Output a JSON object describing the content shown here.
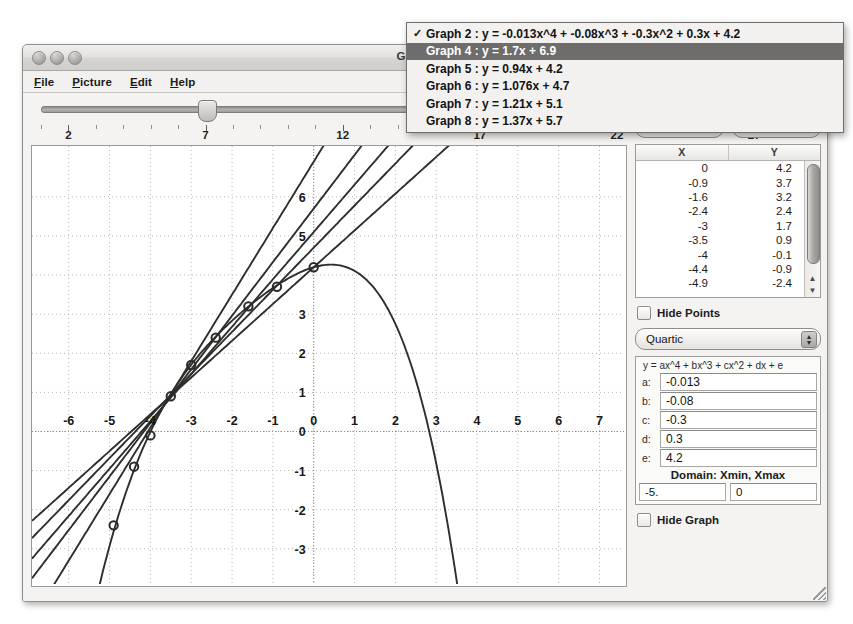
{
  "window": {
    "title": "GridPic /G",
    "traffic_lights": [
      "close",
      "minimize",
      "zoom"
    ],
    "menus": [
      {
        "label": "File",
        "mnemonic": "F"
      },
      {
        "label": "Picture",
        "mnemonic": "P"
      },
      {
        "label": "Edit",
        "mnemonic": "E"
      },
      {
        "label": "Help",
        "mnemonic": "H"
      }
    ]
  },
  "slider": {
    "value": 7,
    "min": 1,
    "max": 29,
    "labels": [
      2,
      7,
      12,
      17,
      22,
      27
    ]
  },
  "graph_menu": {
    "items": [
      {
        "checked": true,
        "selected": false,
        "label": "Graph 2  :  y = -0.013x^4 + -0.08x^3 + -0.3x^2 + 0.3x + 4.2"
      },
      {
        "checked": false,
        "selected": true,
        "label": "Graph 4  :  y = 1.7x + 6.9"
      },
      {
        "checked": false,
        "selected": false,
        "label": "Graph 5  :  y = 0.94x + 4.2"
      },
      {
        "checked": false,
        "selected": false,
        "label": "Graph 6  :  y = 1.076x + 4.7"
      },
      {
        "checked": false,
        "selected": false,
        "label": "Graph 7  :  y = 1.21x + 5.1"
      },
      {
        "checked": false,
        "selected": false,
        "label": "Graph 8  :  y = 1.37x + 5.7"
      }
    ],
    "check_glyph": "✓"
  },
  "buttons": {
    "add_label": "Add",
    "remove_label": "Remove"
  },
  "data_table": {
    "columns": [
      "X",
      "Y"
    ],
    "rows": [
      {
        "x": "0",
        "y": "4.2"
      },
      {
        "x": "-0.9",
        "y": "3.7"
      },
      {
        "x": "-1.6",
        "y": "3.2"
      },
      {
        "x": "-2.4",
        "y": "2.4"
      },
      {
        "x": "-3",
        "y": "1.7"
      },
      {
        "x": "-3.5",
        "y": "0.9"
      },
      {
        "x": "-4",
        "y": "-0.1"
      },
      {
        "x": "-4.4",
        "y": "-0.9"
      },
      {
        "x": "-4.9",
        "y": "-2.4"
      }
    ],
    "scroll_up_glyph": "▲",
    "scroll_down_glyph": "▼"
  },
  "controls": {
    "hide_points_label": "Hide Points",
    "hide_points_checked": false,
    "hide_graph_label": "Hide Graph",
    "hide_graph_checked": false,
    "degree_value": "Quartic",
    "degree_options": [
      "Linear",
      "Quadratic",
      "Cubic",
      "Quartic"
    ]
  },
  "coefficients": {
    "formula": "y = ax^4 + bx^3 + cx^2 + dx + e",
    "fields": [
      {
        "label": "a:",
        "value": "-0.013"
      },
      {
        "label": "b:",
        "value": "-0.08"
      },
      {
        "label": "c:",
        "value": "-0.3"
      },
      {
        "label": "d:",
        "value": "0.3"
      },
      {
        "label": "e:",
        "value": "4.2"
      }
    ],
    "domain_label": "Domain: Xmin, Xmax",
    "xmin": "-5.",
    "xmax": "0"
  },
  "chart_data": {
    "type": "line",
    "title": "",
    "xlabel": "",
    "ylabel": "",
    "xlim": [
      -6.9,
      7.6
    ],
    "ylim": [
      -3.9,
      7.3
    ],
    "xticks": [
      -6,
      -5,
      -4,
      -3,
      -2,
      -1,
      0,
      1,
      2,
      3,
      4,
      5,
      6,
      7
    ],
    "yticks": [
      -3,
      -2,
      -1,
      0,
      1,
      2,
      3,
      4,
      5,
      6
    ],
    "xtick_labels": [
      "-6",
      "-5",
      "-4",
      "-3",
      "-2",
      "-1",
      "0",
      "1",
      "2",
      "3",
      "4",
      "5",
      "6",
      "7"
    ],
    "ytick_labels": [
      "-3",
      "-2",
      "-1",
      "0",
      "1",
      "2",
      "3",
      "4",
      "5",
      "6"
    ],
    "grid": true,
    "grid_style": "dotted",
    "legend": "none",
    "points": [
      {
        "x": 0,
        "y": 4.2
      },
      {
        "x": -0.9,
        "y": 3.7
      },
      {
        "x": -1.6,
        "y": 3.2
      },
      {
        "x": -2.4,
        "y": 2.4
      },
      {
        "x": -3,
        "y": 1.7
      },
      {
        "x": -3.5,
        "y": 0.9
      },
      {
        "x": -4,
        "y": -0.1
      },
      {
        "x": -4.4,
        "y": -0.9
      },
      {
        "x": -4.9,
        "y": -2.4
      }
    ],
    "series": [
      {
        "name": "Graph 2",
        "type": "quartic",
        "a": -0.013,
        "b": -0.08,
        "c": -0.3,
        "d": 0.3,
        "e": 4.2
      },
      {
        "name": "Graph 4",
        "type": "linear",
        "slope": 1.7,
        "intercept": 6.9
      },
      {
        "name": "Graph 5",
        "type": "linear",
        "slope": 0.94,
        "intercept": 4.2
      },
      {
        "name": "Graph 6",
        "type": "linear",
        "slope": 1.076,
        "intercept": 4.7
      },
      {
        "name": "Graph 7",
        "type": "linear",
        "slope": 1.21,
        "intercept": 5.1
      },
      {
        "name": "Graph 8",
        "type": "linear",
        "slope": 1.37,
        "intercept": 5.7
      }
    ]
  }
}
